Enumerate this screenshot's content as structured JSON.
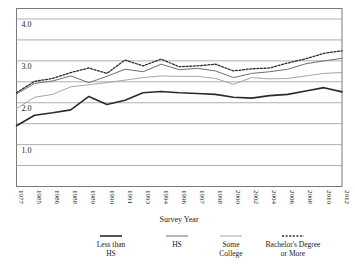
{
  "chart_data": {
    "type": "line",
    "title": "",
    "xlabel": "Survey Year",
    "ylabel": "",
    "ylim": [
      0.0,
      4.25
    ],
    "yticks": [
      4.0,
      3.5,
      3.0,
      2.5,
      2.0,
      1.5,
      1.0,
      0.5
    ],
    "ytick_labels": [
      "4.0",
      "",
      "3.0",
      "",
      "2.0",
      "",
      "1.0",
      ""
    ],
    "grid": true,
    "legend_position": "bottom",
    "categories": [
      "1977",
      "1985",
      "1986",
      "1988",
      "1989",
      "1990",
      "1991",
      "1993",
      "1994",
      "1996",
      "1997",
      "1998",
      "2000",
      "2002",
      "2004",
      "2006",
      "2008",
      "2010",
      "2012"
    ],
    "series": [
      {
        "name": "Less than HS",
        "style": "solid-thick",
        "color": "#2b2b2b",
        "values": [
          1.45,
          1.7,
          1.76,
          1.83,
          2.15,
          1.96,
          2.06,
          2.24,
          2.27,
          2.24,
          2.22,
          2.2,
          2.13,
          2.11,
          2.17,
          2.2,
          2.28,
          2.36,
          2.26
        ]
      },
      {
        "name": "HS",
        "style": "solid-medium",
        "color": "#6e6e6e",
        "values": [
          2.21,
          2.46,
          2.52,
          2.64,
          2.48,
          2.63,
          2.8,
          2.74,
          2.92,
          2.79,
          2.82,
          2.76,
          2.6,
          2.7,
          2.74,
          2.8,
          2.93,
          3.0,
          3.06
        ]
      },
      {
        "name": "Some College",
        "style": "solid-light",
        "color": "#a6a6a6",
        "values": [
          1.86,
          2.13,
          2.2,
          2.38,
          2.43,
          2.48,
          2.54,
          2.6,
          2.64,
          2.63,
          2.63,
          2.58,
          2.44,
          2.6,
          2.57,
          2.58,
          2.64,
          2.7,
          2.72
        ]
      },
      {
        "name": "Bachelor's Degree or More",
        "style": "dotted",
        "color": "#2b2b2b",
        "values": [
          2.24,
          2.51,
          2.58,
          2.72,
          2.83,
          2.7,
          3.02,
          2.88,
          3.04,
          2.86,
          2.88,
          2.92,
          2.76,
          2.81,
          2.83,
          2.95,
          3.05,
          3.18,
          3.24
        ]
      }
    ]
  },
  "legend": {
    "items": [
      {
        "label_line1": "Less than",
        "label_line2": "HS",
        "marker": "solid-thick"
      },
      {
        "label_line1": "HS",
        "label_line2": "",
        "marker": "solid-medium"
      },
      {
        "label_line1": "Some",
        "label_line2": "College",
        "marker": "solid-light"
      },
      {
        "label_line1": "Bachelor's Degree",
        "label_line2": "or More",
        "marker": "dotted"
      }
    ]
  },
  "colors": {
    "less_than_hs": "#2b2b2b",
    "hs": "#6e6e6e",
    "some_college": "#a6a6a6",
    "bachelors": "#2b2b2b",
    "gridline": "#9a9a9a",
    "background": "#ffffff"
  }
}
